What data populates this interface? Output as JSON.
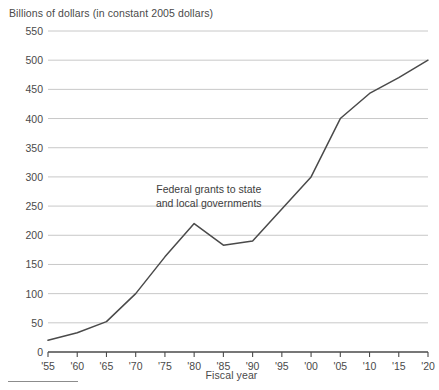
{
  "chart_data": {
    "type": "line",
    "title": "Billions of dollars (in constant 2005 dollars)",
    "xlabel": "Fiscal year",
    "ylabel": "",
    "annotation": {
      "line1": "Federal grants to state",
      "line2": "and local governments"
    },
    "grid": true,
    "legend": "none",
    "xlim": [
      1955,
      2020
    ],
    "ylim": [
      0,
      550
    ],
    "ytick_values": [
      0,
      50,
      100,
      150,
      200,
      250,
      300,
      350,
      400,
      450,
      500,
      550
    ],
    "ytick_labels": [
      "0",
      "50",
      "100",
      "150",
      "200",
      "250",
      "300",
      "350",
      "400",
      "450",
      "500",
      "550"
    ],
    "xtick_values": [
      1955,
      1960,
      1965,
      1970,
      1975,
      1980,
      1985,
      1990,
      1995,
      2000,
      2005,
      2010,
      2015,
      2020
    ],
    "xtick_labels": [
      "'55",
      "'60",
      "'65",
      "'70",
      "'75",
      "'80",
      "'85",
      "'90",
      "'95",
      "'00",
      "'05",
      "'10",
      "'15",
      "'20"
    ],
    "x": [
      1955,
      1960,
      1965,
      1970,
      1975,
      1980,
      1985,
      1990,
      1995,
      2000,
      2005,
      2010,
      2015,
      2020
    ],
    "values": [
      20,
      33,
      52,
      100,
      163,
      220,
      183,
      190,
      245,
      300,
      400,
      443,
      470,
      500
    ],
    "series": [
      {
        "name": "Federal grants to state and local governments",
        "values": [
          20,
          33,
          52,
          100,
          163,
          220,
          183,
          190,
          245,
          300,
          400,
          443,
          470,
          500
        ]
      }
    ],
    "line_color": "#4a4a4a",
    "grid_color": "#c8c8c8",
    "axis_color": "#4a4a4a",
    "background_color": "#ffffff"
  }
}
